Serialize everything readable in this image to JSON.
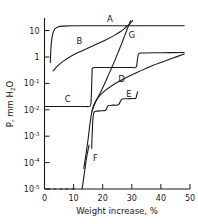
{
  "chart_data": {
    "type": "line",
    "title": "",
    "xlabel": "Weight increase, %",
    "ylabel": "P, mm H2O",
    "ylabel_display": "P, mm H",
    "ylabel_sub": "2",
    "ylabel_tail": "O",
    "xlim": [
      0,
      50
    ],
    "ylim": [
      1e-05,
      30
    ],
    "yscale": "log",
    "xscale": "linear",
    "grid": false,
    "legend": "inline-curve-labels",
    "xticks": [
      0,
      10,
      20,
      30,
      40,
      50
    ],
    "xtick_labels": [
      "0",
      "10",
      "20",
      "30",
      "40",
      "50"
    ],
    "yticks": [
      10,
      1,
      0.1,
      0.01,
      0.001,
      0.0001,
      1e-05
    ],
    "ytick_labels": [
      {
        "mantissa": "10",
        "exponent": ""
      },
      {
        "mantissa": "1",
        "exponent": ""
      },
      {
        "mantissa": "10",
        "exponent": "-1"
      },
      {
        "mantissa": "10",
        "exponent": "-2"
      },
      {
        "mantissa": "10",
        "exponent": "-3"
      },
      {
        "mantissa": "10",
        "exponent": "-4"
      },
      {
        "mantissa": "10",
        "exponent": "-5"
      }
    ],
    "series": [
      {
        "name": "A",
        "label": "A",
        "label_x": 22.5,
        "label_y": 22,
        "style": "solid",
        "points": [
          [
            2.0,
            0.62
          ],
          [
            2.1,
            1.2
          ],
          [
            2.3,
            3.0
          ],
          [
            2.7,
            6.5
          ],
          [
            3.4,
            11.0
          ],
          [
            4.6,
            13.8
          ],
          [
            6.5,
            14.8
          ],
          [
            10.0,
            15.2
          ],
          [
            18.0,
            15.3
          ],
          [
            30.0,
            15.3
          ],
          [
            40.0,
            15.3
          ],
          [
            48.0,
            15.3
          ]
        ]
      },
      {
        "name": "B",
        "label": "B",
        "label_x": 12.0,
        "label_y": 3.0,
        "style": "solid",
        "points": [
          [
            3.0,
            0.3
          ],
          [
            4.5,
            0.46
          ],
          [
            6.5,
            0.7
          ],
          [
            9.0,
            1.05
          ],
          [
            12.0,
            1.55
          ],
          [
            15.0,
            2.2
          ],
          [
            18.0,
            3.1
          ],
          [
            21.0,
            4.4
          ],
          [
            24.0,
            6.6
          ],
          [
            26.0,
            9.0
          ],
          [
            27.5,
            12.0
          ],
          [
            28.5,
            15.0
          ],
          [
            29.5,
            19.0
          ],
          [
            30.3,
            24.0
          ]
        ]
      },
      {
        "name": "C",
        "label": "C",
        "label_x": 8.0,
        "label_y": 0.0195,
        "style": "solid",
        "points": [
          [
            0.3,
            0.0133
          ],
          [
            5.0,
            0.0133
          ],
          [
            10.0,
            0.0133
          ],
          [
            14.0,
            0.0133
          ],
          [
            15.6,
            0.0135
          ],
          [
            16.0,
            0.02
          ],
          [
            16.2,
            0.08
          ],
          [
            16.35,
            0.25
          ],
          [
            16.5,
            0.38
          ],
          [
            18.0,
            0.4
          ],
          [
            22.0,
            0.4
          ],
          [
            26.0,
            0.4
          ],
          [
            30.0,
            0.4
          ],
          [
            31.5,
            0.42
          ],
          [
            32.0,
            0.9
          ],
          [
            32.4,
            1.35
          ],
          [
            34.0,
            1.42
          ],
          [
            40.0,
            1.45
          ],
          [
            48.0,
            1.48
          ]
        ]
      },
      {
        "name": "D",
        "label": "D",
        "label_x": 26.5,
        "label_y": 0.115,
        "style": "solid",
        "points": [
          [
            13.5,
            6e-05
          ],
          [
            14.3,
            0.00022
          ],
          [
            15.0,
            0.0008
          ],
          [
            15.6,
            0.0028
          ],
          [
            16.2,
            0.0075
          ],
          [
            17.0,
            0.016
          ],
          [
            18.5,
            0.03
          ],
          [
            20.5,
            0.05
          ],
          [
            23.0,
            0.08
          ],
          [
            26.0,
            0.125
          ],
          [
            29.0,
            0.185
          ],
          [
            32.5,
            0.28
          ],
          [
            36.0,
            0.42
          ],
          [
            40.0,
            0.62
          ],
          [
            44.0,
            0.9
          ],
          [
            48.0,
            1.3
          ]
        ]
      },
      {
        "name": "E",
        "label": "E",
        "label_x": 29.0,
        "label_y": 0.03,
        "style": "solid",
        "points": [
          [
            16.2,
            0.00035
          ],
          [
            16.4,
            0.0013
          ],
          [
            16.6,
            0.004
          ],
          [
            16.9,
            0.0075
          ],
          [
            17.6,
            0.0088
          ],
          [
            19.6,
            0.0092
          ],
          [
            21.0,
            0.0096
          ],
          [
            21.6,
            0.013
          ],
          [
            22.0,
            0.0145
          ],
          [
            23.6,
            0.015
          ],
          [
            25.4,
            0.0155
          ],
          [
            26.2,
            0.022
          ],
          [
            26.7,
            0.0255
          ],
          [
            28.5,
            0.0262
          ],
          [
            30.5,
            0.0268
          ],
          [
            31.4,
            0.0275
          ],
          [
            31.8,
            0.04
          ],
          [
            32.0,
            0.048
          ]
        ]
      },
      {
        "name": "F",
        "label": "F",
        "label_x": 17.5,
        "label_y": 0.00012,
        "style": "solid",
        "points": [
          [
            12.9,
            9.8e-06
          ],
          [
            13.1,
            1.35e-05
          ],
          [
            13.4,
            2.3e-05
          ],
          [
            13.8,
            4.8e-05
          ],
          [
            14.2,
            0.0001
          ],
          [
            14.6,
            0.00019
          ],
          [
            15.0,
            0.00031
          ],
          [
            15.3,
            0.00046
          ]
        ]
      },
      {
        "name": "F-dashed",
        "label": "",
        "style": "dashed",
        "points": [
          [
            0.9,
            1e-05
          ],
          [
            11.2,
            1e-05
          ]
        ]
      },
      {
        "name": "G",
        "label": "G",
        "label_x": 30.0,
        "label_y": 5.2,
        "style": "solid",
        "points": [
          [
            16.3,
            0.0088
          ],
          [
            17.2,
            0.016
          ],
          [
            18.4,
            0.03
          ],
          [
            19.6,
            0.055
          ],
          [
            20.8,
            0.105
          ],
          [
            22.0,
            0.21
          ],
          [
            23.2,
            0.42
          ],
          [
            24.4,
            0.85
          ],
          [
            25.6,
            1.8
          ],
          [
            26.6,
            3.4
          ],
          [
            27.5,
            6.2
          ],
          [
            28.3,
            10.5
          ],
          [
            29.0,
            16.5
          ],
          [
            29.6,
            24.0
          ]
        ]
      }
    ]
  }
}
